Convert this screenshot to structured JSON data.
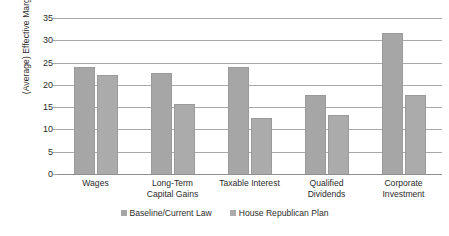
{
  "chart_data": {
    "type": "bar",
    "title": "",
    "xlabel": "",
    "ylabel": "(Average) Effective Marginal Tax Rate",
    "ylim": [
      0,
      35
    ],
    "ytick_step": 5,
    "yticks": [
      "35",
      "30",
      "25",
      "20",
      "15",
      "10",
      "5",
      "0"
    ],
    "grid": true,
    "legend_position": "bottom",
    "categories": [
      "Wages",
      "Long-Term Capital Gains",
      "Taxable Interest",
      "Qualified Dividends",
      "Corporate Investment"
    ],
    "category_lines": [
      [
        "Wages"
      ],
      [
        "Long-Term",
        "Capital Gains"
      ],
      [
        "Taxable Interest"
      ],
      [
        "Qualified",
        "Dividends"
      ],
      [
        "Corporate",
        "Investment"
      ]
    ],
    "series": [
      {
        "name": "Baseline/Current Law",
        "color": "#a6a6a6",
        "values": [
          23.8,
          22.4,
          23.8,
          17.5,
          31.5
        ]
      },
      {
        "name": "House Republican Plan",
        "color": "#ababab",
        "values": [
          22.1,
          15.5,
          12.3,
          13.1,
          17.5
        ]
      }
    ]
  },
  "legend": {
    "items": [
      {
        "label": "Baseline/Current Law"
      },
      {
        "label": "House Republican Plan"
      }
    ]
  }
}
